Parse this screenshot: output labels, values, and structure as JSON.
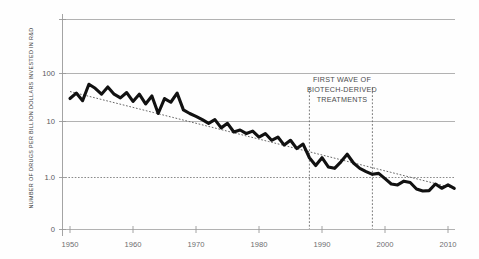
{
  "chart_data": {
    "type": "line",
    "title": "",
    "subtitle": "",
    "xlabel": "",
    "ylabel": "NUMBER OF DRUGS PER BILLION DOLLARS INVESTED IN R&D",
    "yscale": "log",
    "ylim": [
      0.3,
      1000
    ],
    "xlim": [
      1950,
      2012
    ],
    "grid": true,
    "legend": "none",
    "y_ticks": [
      {
        "value": 1000,
        "label": ""
      },
      {
        "value": 100,
        "label": "100"
      },
      {
        "value": 10,
        "label": "10"
      },
      {
        "value": 1.0,
        "label": "1.0"
      },
      {
        "value": 0.3,
        "label": "0"
      }
    ],
    "x_ticks": [
      {
        "value": 1950,
        "label": "1950"
      },
      {
        "value": 1960,
        "label": "1960"
      },
      {
        "value": 1970,
        "label": "1970"
      },
      {
        "value": 1980,
        "label": "1980"
      },
      {
        "value": 1990,
        "label": "1990"
      },
      {
        "value": 2000,
        "label": "2000"
      },
      {
        "value": 2010,
        "label": "2010"
      }
    ],
    "annotations": [
      {
        "name": "first-wave-biotech",
        "lines": [
          "FIRST WAVE OF",
          "BIOTECH-DERIVED",
          "TREATMENTS"
        ],
        "x": 1993.5,
        "y_top": 260
      }
    ],
    "vertical_markers": [
      {
        "x": 1988,
        "style": "dotted"
      },
      {
        "x": 1998,
        "style": "dotted"
      }
    ],
    "series": [
      {
        "name": "drugs-per-billion",
        "style": "solid-thick",
        "color": "#111111",
        "x": [
          1950,
          1951,
          1952,
          1953,
          1954,
          1955,
          1956,
          1957,
          1958,
          1959,
          1960,
          1961,
          1962,
          1963,
          1964,
          1965,
          1966,
          1967,
          1968,
          1969,
          1970,
          1971,
          1972,
          1973,
          1974,
          1975,
          1976,
          1977,
          1978,
          1979,
          1980,
          1981,
          1982,
          1983,
          1984,
          1985,
          1986,
          1987,
          1988,
          1989,
          1990,
          1991,
          1992,
          1993,
          1994,
          1995,
          1996,
          1997,
          1998,
          1999,
          2000,
          2001,
          2002,
          2003,
          2004,
          2005,
          2006,
          2007,
          2008,
          2009,
          2010,
          2011
        ],
        "values": [
          33,
          42,
          30,
          62,
          52,
          40,
          55,
          40,
          34,
          43,
          29,
          40,
          26,
          37,
          17,
          33,
          28,
          42,
          20,
          17,
          15,
          13,
          11,
          13,
          9.0,
          11,
          7.5,
          8.2,
          7.0,
          7.8,
          6.0,
          7.0,
          5.2,
          6.0,
          4.2,
          5.2,
          3.6,
          4.4,
          2.4,
          1.7,
          2.4,
          1.6,
          1.5,
          2.0,
          2.8,
          1.9,
          1.5,
          1.3,
          1.15,
          1.2,
          0.95,
          0.75,
          0.72,
          0.85,
          0.8,
          0.6,
          0.55,
          0.56,
          0.75,
          0.62,
          0.72,
          0.62
        ]
      },
      {
        "name": "exponential-trend",
        "style": "dotted",
        "color": "#555555",
        "x": [
          1950,
          2011
        ],
        "values": [
          45,
          0.62
        ]
      }
    ]
  },
  "axis": {
    "ylabel": "NUMBER OF DRUGS PER BILLION DOLLARS INVESTED IN R&D",
    "y_tick_100": "100",
    "y_tick_10": "10",
    "y_tick_1": "1.0",
    "y_tick_0": "0",
    "x_tick_1950": "1950",
    "x_tick_1960": "1960",
    "x_tick_1970": "1970",
    "x_tick_1980": "1980",
    "x_tick_1990": "1990",
    "x_tick_2000": "2000",
    "x_tick_2010": "2010"
  },
  "annotation": {
    "line1": "FIRST WAVE OF",
    "line2": "BIOTECH-DERIVED",
    "line3": "TREATMENTS"
  },
  "colors": {
    "series": "#111111",
    "trend": "#555555",
    "grid": "#a8a8a8",
    "axis": "#9a9a9a",
    "text": "#58585a",
    "background": "#fefefe"
  }
}
